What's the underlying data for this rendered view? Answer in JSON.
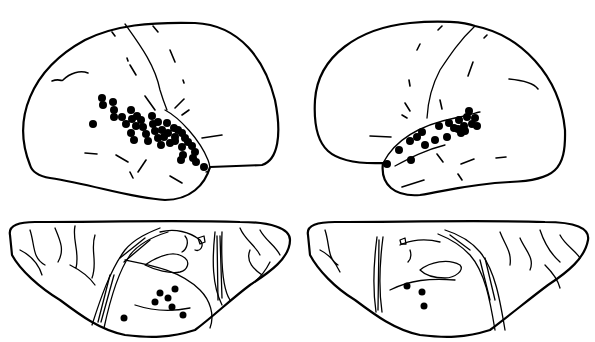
{
  "figure": {
    "panels": [
      {
        "id": "left-lateral",
        "label": "Left hemisphere lateral view",
        "marker_count": 44
      },
      {
        "id": "right-lateral",
        "label": "Right hemisphere lateral view",
        "marker_count": 22
      },
      {
        "id": "left-ventral",
        "label": "Left hemisphere ventral view",
        "marker_count": 7
      },
      {
        "id": "right-ventral",
        "label": "Right hemisphere ventral view",
        "marker_count": 3
      }
    ],
    "colors": {
      "line": "#000000",
      "background": "#ffffff",
      "marker": "#000000"
    }
  }
}
